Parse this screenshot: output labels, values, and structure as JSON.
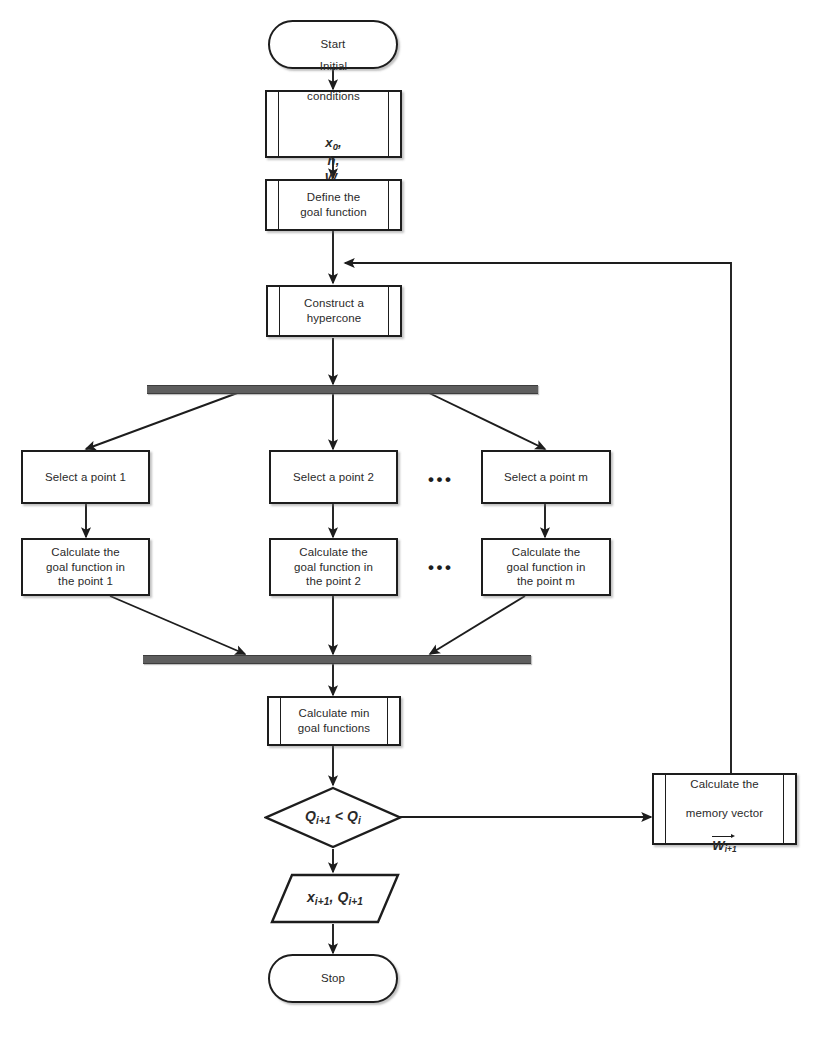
{
  "diagram": {
    "type": "flowchart",
    "colors": {
      "stroke": "#1d1d1d",
      "fill": "#ffffff",
      "sync_bar": "#5e5e5e",
      "text": "#2a2a2a"
    }
  },
  "nodes": {
    "start": {
      "label": "Start",
      "shape": "terminator"
    },
    "initial_conditions": {
      "label_line1": "Initial",
      "label_line2": "conditions",
      "label_math_x": "x",
      "label_math_x_sub": "0",
      "label_math_h": "h",
      "label_math_w": "W",
      "label_math_w_sub": "0",
      "shape": "predefined-process"
    },
    "define_goal": {
      "label": "Define the\ngoal function",
      "shape": "predefined-process"
    },
    "construct_hypercone": {
      "label": "Construct a\nhypercone",
      "shape": "predefined-process"
    },
    "fork_bar": {
      "label": "",
      "shape": "sync-bar"
    },
    "select_point_1": {
      "label": "Select a point 1",
      "shape": "process"
    },
    "select_point_2": {
      "label": "Select a point 2",
      "shape": "process"
    },
    "select_point_m": {
      "label": "Select a point m",
      "shape": "process"
    },
    "calc_goal_1": {
      "label": "Calculate the\ngoal function in\nthe point 1",
      "shape": "process"
    },
    "calc_goal_2": {
      "label": "Calculate the\ngoal function in\nthe point 2",
      "shape": "process"
    },
    "calc_goal_m": {
      "label": "Calculate the\ngoal function in\nthe point m",
      "shape": "process"
    },
    "ellipsis_top": {
      "label": "•••"
    },
    "ellipsis_bottom": {
      "label": "•••"
    },
    "join_bar": {
      "label": "",
      "shape": "sync-bar"
    },
    "calc_min": {
      "label": "Calculate min\ngoal functions",
      "shape": "predefined-process"
    },
    "decision": {
      "label_q": "Q",
      "label_q_sub": "i+1",
      "label_op": " < ",
      "label_q2": "Q",
      "label_q2_sub": "i",
      "shape": "decision"
    },
    "memory_vector": {
      "label_line1": "Calculate the",
      "label_line2": "memory vector",
      "label_vec": "W",
      "label_vec_sub": "i+1",
      "shape": "predefined-process"
    },
    "output": {
      "label_x": "x",
      "label_x_sub": "i+1",
      "label_sep": ", ",
      "label_q": "Q",
      "label_q_sub": "i+1",
      "shape": "parallelogram"
    },
    "stop": {
      "label": "Stop",
      "shape": "terminator"
    }
  },
  "edges": [
    {
      "from": "start",
      "to": "initial_conditions",
      "label": ""
    },
    {
      "from": "initial_conditions",
      "to": "define_goal",
      "label": ""
    },
    {
      "from": "define_goal",
      "to": "construct_hypercone",
      "label": ""
    },
    {
      "from": "construct_hypercone",
      "to": "fork_bar",
      "label": ""
    },
    {
      "from": "fork_bar",
      "to": "select_point_1",
      "label": ""
    },
    {
      "from": "fork_bar",
      "to": "select_point_2",
      "label": ""
    },
    {
      "from": "fork_bar",
      "to": "select_point_m",
      "label": ""
    },
    {
      "from": "select_point_1",
      "to": "calc_goal_1",
      "label": ""
    },
    {
      "from": "select_point_2",
      "to": "calc_goal_2",
      "label": ""
    },
    {
      "from": "select_point_m",
      "to": "calc_goal_m",
      "label": ""
    },
    {
      "from": "calc_goal_1",
      "to": "join_bar",
      "label": ""
    },
    {
      "from": "calc_goal_2",
      "to": "join_bar",
      "label": ""
    },
    {
      "from": "calc_goal_m",
      "to": "join_bar",
      "label": ""
    },
    {
      "from": "join_bar",
      "to": "calc_min",
      "label": ""
    },
    {
      "from": "calc_min",
      "to": "decision",
      "label": ""
    },
    {
      "from": "decision",
      "to": "memory_vector",
      "label": ""
    },
    {
      "from": "decision",
      "to": "output",
      "label": ""
    },
    {
      "from": "memory_vector",
      "to": "construct_hypercone",
      "label": ""
    },
    {
      "from": "output",
      "to": "stop",
      "label": ""
    }
  ]
}
